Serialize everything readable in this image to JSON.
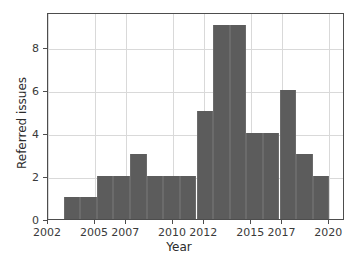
{
  "chart_data": {
    "type": "bar",
    "title": "",
    "subtitle": "",
    "xlabel": "Year",
    "ylabel": "Referred issues",
    "xlim": [
      2002,
      2021
    ],
    "ylim": [
      0,
      9.6
    ],
    "grid": true,
    "legend": null,
    "legend_position": "none",
    "bar_color": "#5c5c5c",
    "grid_color": "#d9d9d9",
    "axis_color": "#4d4d4d",
    "background_color": "#ffffff",
    "xticks": [
      2002,
      2005,
      2007,
      2010,
      2012,
      2015,
      2017,
      2020
    ],
    "xtick_labels": [
      "2002",
      "2005",
      "2007",
      "2010",
      "2012",
      "2015",
      "2017",
      "2020"
    ],
    "yticks": [
      0,
      2,
      4,
      6,
      8
    ],
    "ytick_labels": [
      "0",
      "2",
      "4",
      "6",
      "8"
    ],
    "bin_edges": [
      2003.0,
      2004.06,
      2005.13,
      2006.19,
      2007.25,
      2008.31,
      2009.38,
      2010.44,
      2011.5,
      2012.56,
      2013.63,
      2014.69,
      2015.75,
      2016.81,
      2017.88,
      2018.94,
      2020.0
    ],
    "categories": [
      "2003-2004",
      "2004-2005",
      "2005-2006",
      "2006-2007",
      "2007-2008",
      "2008-2009",
      "2009-2010",
      "2010-2011",
      "2011-2013",
      "2013-2014",
      "2014-2015",
      "2015-2017",
      "2017-2018",
      "2018-2019",
      "2019-2020"
    ],
    "values": [
      1,
      2,
      2,
      3,
      2,
      2,
      2,
      5,
      9,
      4,
      4,
      6,
      3,
      3,
      2
    ],
    "bars": [
      {
        "x0": 2003.0,
        "x1": 2004.06,
        "value": 1
      },
      {
        "x0": 2004.06,
        "x1": 2005.13,
        "value": 1
      },
      {
        "x0": 2005.13,
        "x1": 2006.19,
        "value": 2
      },
      {
        "x0": 2006.19,
        "x1": 2007.25,
        "value": 2
      },
      {
        "x0": 2007.25,
        "x1": 2008.31,
        "value": 3
      },
      {
        "x0": 2008.31,
        "x1": 2009.38,
        "value": 2
      },
      {
        "x0": 2009.38,
        "x1": 2010.44,
        "value": 2
      },
      {
        "x0": 2010.44,
        "x1": 2011.5,
        "value": 2
      },
      {
        "x0": 2011.5,
        "x1": 2012.56,
        "value": 5
      },
      {
        "x0": 2012.56,
        "x1": 2013.63,
        "value": 9
      },
      {
        "x0": 2013.63,
        "x1": 2014.69,
        "value": 9
      },
      {
        "x0": 2014.69,
        "x1": 2015.75,
        "value": 4
      },
      {
        "x0": 2015.75,
        "x1": 2016.81,
        "value": 4
      },
      {
        "x0": 2016.81,
        "x1": 2017.88,
        "value": 6
      },
      {
        "x0": 2017.88,
        "x1": 2018.94,
        "value": 3
      },
      {
        "x0": 2018.94,
        "x1": 2020.0,
        "value": 2
      }
    ]
  }
}
